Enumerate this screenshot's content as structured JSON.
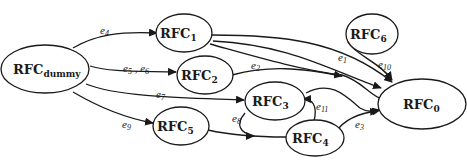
{
  "diagram": {
    "type": "directed-graph",
    "nodes": [
      {
        "id": "dummy",
        "base": "RFC",
        "sub": "dummy"
      },
      {
        "id": "1",
        "base": "RFC",
        "sub": "1"
      },
      {
        "id": "2",
        "base": "RFC",
        "sub": "2"
      },
      {
        "id": "3",
        "base": "RFC",
        "sub": "3"
      },
      {
        "id": "4",
        "base": "RFC",
        "sub": "4"
      },
      {
        "id": "5",
        "base": "RFC",
        "sub": "5"
      },
      {
        "id": "6",
        "base": "RFC",
        "sub": "6"
      },
      {
        "id": "0",
        "base": "RFC",
        "sub": "0"
      }
    ],
    "edges": [
      {
        "from": "dummy",
        "to": "1",
        "label": "e",
        "sub": "4"
      },
      {
        "from": "dummy",
        "to": "2",
        "label": "e",
        "sub": "5",
        "label2": "e",
        "sub2": "6",
        "sep": " , "
      },
      {
        "from": "dummy",
        "to": "3",
        "label": "e",
        "sub": "7"
      },
      {
        "from": "dummy",
        "to": "5",
        "label": "e",
        "sub": "9"
      },
      {
        "from": "1",
        "to": "0",
        "label": "e",
        "sub": "1"
      },
      {
        "from": "1",
        "to": "0",
        "label": "",
        "sub": ""
      },
      {
        "from": "1",
        "to": "0",
        "label": "",
        "sub": ""
      },
      {
        "from": "2",
        "to": "0",
        "label": "e",
        "sub": "2"
      },
      {
        "from": "3",
        "to": "0",
        "label": "",
        "sub": ""
      },
      {
        "from": "3",
        "to": "4",
        "label": "e",
        "sub": "8"
      },
      {
        "from": "5",
        "to": "4",
        "label": "",
        "sub": ""
      },
      {
        "from": "4",
        "to": "3",
        "label": "e",
        "sub": "11"
      },
      {
        "from": "4",
        "to": "0",
        "label": "e",
        "sub": "3"
      },
      {
        "from": "6",
        "to": "0",
        "label": "e",
        "sub": "10"
      }
    ]
  }
}
